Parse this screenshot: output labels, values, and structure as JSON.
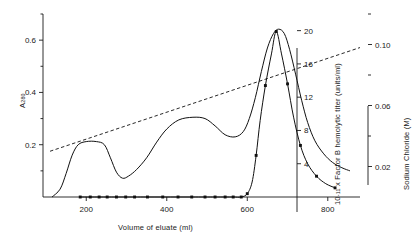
{
  "chart_data": {
    "type": "line",
    "title": "",
    "xlabel": "Volume of eluate (ml)",
    "xlim": [
      100,
      880
    ],
    "xticks": [
      200,
      400,
      600,
      800
    ],
    "xtick_labels": [
      "200",
      "400",
      "600",
      "800"
    ],
    "grid": false,
    "legend": "none",
    "axes": [
      {
        "id": "a280",
        "position": "left",
        "label": "A 280",
        "label_main": "A",
        "label_sub": "280",
        "lim": [
          0,
          0.7
        ],
        "ticks": [
          0.2,
          0.4,
          0.6
        ],
        "tick_labels": [
          "0.2",
          "0.4",
          "0.6"
        ],
        "minor_ticks": [
          0.1,
          0.3,
          0.5,
          0.7
        ]
      },
      {
        "id": "titer",
        "position": "right-inner",
        "label": "10 -11 x Factor B hemolytic titer (units/ml)",
        "label_prefix": "10",
        "label_exponent": "-11",
        "label_rest": "x Factor B hemolytic titer (units/ml)",
        "lim": [
          0,
          22
        ],
        "ticks": [
          4,
          8,
          12,
          16,
          20
        ],
        "tick_labels": [
          "4",
          "8",
          "12",
          "16",
          "20"
        ]
      },
      {
        "id": "nacl",
        "position": "right-outer",
        "label": "Sodium Chloride (M)",
        "lim": [
          0,
          0.12
        ],
        "ticks": [
          0.02,
          0.06,
          0.1
        ],
        "tick_labels": [
          "0.02",
          "0.06",
          "0.10"
        ],
        "minor_ticks": [
          0.04,
          0.08,
          0.12
        ]
      }
    ],
    "series": [
      {
        "name": "A280 absorbance",
        "axis": "a280",
        "style": "solid",
        "marker": "none",
        "points": [
          [
            115,
            0.0
          ],
          [
            135,
            0.03
          ],
          [
            150,
            0.09
          ],
          [
            165,
            0.16
          ],
          [
            180,
            0.2
          ],
          [
            200,
            0.212
          ],
          [
            225,
            0.212
          ],
          [
            245,
            0.2
          ],
          [
            260,
            0.15
          ],
          [
            275,
            0.095
          ],
          [
            290,
            0.072
          ],
          [
            305,
            0.08
          ],
          [
            325,
            0.105
          ],
          [
            350,
            0.15
          ],
          [
            375,
            0.21
          ],
          [
            400,
            0.26
          ],
          [
            430,
            0.295
          ],
          [
            465,
            0.305
          ],
          [
            495,
            0.3
          ],
          [
            520,
            0.272
          ],
          [
            545,
            0.238
          ],
          [
            570,
            0.23
          ],
          [
            590,
            0.25
          ],
          [
            605,
            0.3
          ],
          [
            620,
            0.38
          ],
          [
            635,
            0.48
          ],
          [
            650,
            0.57
          ],
          [
            665,
            0.625
          ],
          [
            678,
            0.642
          ],
          [
            692,
            0.625
          ],
          [
            705,
            0.565
          ],
          [
            720,
            0.47
          ],
          [
            735,
            0.37
          ],
          [
            750,
            0.285
          ],
          [
            768,
            0.215
          ],
          [
            790,
            0.165
          ],
          [
            812,
            0.132
          ],
          [
            835,
            0.112
          ],
          [
            855,
            0.1
          ]
        ]
      },
      {
        "name": "Factor B hemolytic titer",
        "axis": "titer",
        "style": "solid",
        "marker": "filled-square",
        "points": [
          [
            185,
            0.0
          ],
          [
            210,
            0.0
          ],
          [
            232,
            0.0
          ],
          [
            252,
            0.0
          ],
          [
            275,
            0.0
          ],
          [
            298,
            0.0
          ],
          [
            320,
            0.0
          ],
          [
            352,
            0.0
          ],
          [
            390,
            0.0
          ],
          [
            428,
            0.0
          ],
          [
            462,
            0.0
          ],
          [
            495,
            0.0
          ],
          [
            520,
            0.0
          ],
          [
            545,
            0.0
          ],
          [
            565,
            0.0
          ],
          [
            585,
            0.0
          ],
          [
            600,
            0.4
          ],
          [
            612,
            1.8
          ],
          [
            622,
            5.0
          ],
          [
            632,
            9.2
          ],
          [
            645,
            13.4
          ],
          [
            660,
            17.2
          ],
          [
            672,
            19.9
          ],
          [
            685,
            17.2
          ],
          [
            700,
            13.6
          ],
          [
            715,
            9.6
          ],
          [
            732,
            6.2
          ],
          [
            750,
            4.0
          ],
          [
            772,
            2.5
          ],
          [
            795,
            1.6
          ],
          [
            818,
            1.1
          ]
        ],
        "marker_points": [
          [
            185,
            0.0
          ],
          [
            210,
            0.0
          ],
          [
            232,
            0.0
          ],
          [
            252,
            0.0
          ],
          [
            275,
            0.0
          ],
          [
            298,
            0.0
          ],
          [
            320,
            0.0
          ],
          [
            352,
            0.0
          ],
          [
            390,
            0.0
          ],
          [
            428,
            0.0
          ],
          [
            462,
            0.0
          ],
          [
            495,
            0.0
          ],
          [
            520,
            0.0
          ],
          [
            545,
            0.0
          ],
          [
            565,
            0.0
          ],
          [
            585,
            0.0
          ],
          [
            600,
            0.4
          ],
          [
            622,
            5.0
          ],
          [
            645,
            13.4
          ],
          [
            672,
            19.9
          ],
          [
            700,
            13.6
          ],
          [
            732,
            6.2
          ],
          [
            772,
            2.5
          ],
          [
            818,
            1.1
          ]
        ]
      },
      {
        "name": "Sodium chloride gradient",
        "axis": "nacl",
        "style": "dashed",
        "marker": "none",
        "points": [
          [
            110,
            0.03
          ],
          [
            880,
            0.098
          ]
        ]
      }
    ]
  }
}
